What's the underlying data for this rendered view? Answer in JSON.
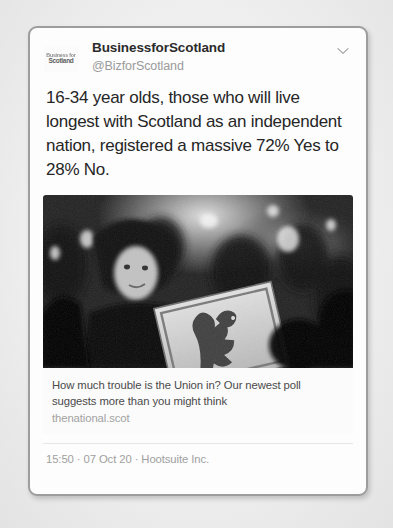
{
  "tweet": {
    "avatar": {
      "icon": "business-for-scotland-logo",
      "line1": "Business for",
      "line2": "Scotland"
    },
    "display_name": "BusinessforScotland",
    "handle": "@BizforScotland",
    "menu_icon": "chevron-down-icon",
    "text": "16-34 year olds, those who will live longest with Scotland as an independent nation, registered a massive 72% Yes to 28% No.",
    "link_card": {
      "image_alt": "crowd-at-night-with-lion-rampant-flag",
      "title": "How much trouble is the Union in? Our newest poll suggests more than you might think",
      "domain": "thenational.scot"
    },
    "footer": {
      "time": "15:50",
      "sep1": "·",
      "date": "07 Oct 20",
      "sep2": "·",
      "client": "Hootsuite Inc.",
      "full": "15:50 · 07 Oct 20 · Hootsuite Inc."
    }
  },
  "colors": {
    "page_bg": "#efefef",
    "card_bg": "#fdfdfd",
    "card_border": "#9d9d9d",
    "text_primary": "#262626",
    "text_muted": "#9a9a9a"
  }
}
